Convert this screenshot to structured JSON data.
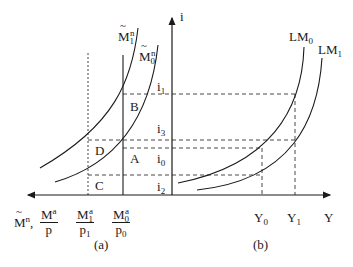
{
  "diagram": {
    "panels": [
      {
        "id": "a",
        "caption": "(a)"
      },
      {
        "id": "b",
        "caption": "(b)"
      }
    ],
    "axes": {
      "vertical_label": "i",
      "horizontal_right_label": "Y",
      "horizontal_left_label_main": "M",
      "horizontal_left_label_main_sup": "n",
      "horizontal_left_label_frac_num": "M",
      "horizontal_left_label_frac_num_sup": "a",
      "horizontal_left_label_frac_den": "p"
    },
    "curves": {
      "m1n": {
        "base": "M",
        "sub": "1",
        "sup": "n"
      },
      "m0n": {
        "base": "M",
        "sub": "0",
        "sup": "n"
      },
      "lm0": {
        "base": "LM",
        "sub": "0"
      },
      "lm1": {
        "base": "LM",
        "sub": "1"
      }
    },
    "interest_levels": [
      {
        "base": "i",
        "sub": "1"
      },
      {
        "base": "i",
        "sub": "3"
      },
      {
        "base": "i",
        "sub": "0"
      },
      {
        "base": "i",
        "sub": "2"
      }
    ],
    "points": [
      "B",
      "D",
      "A",
      "C"
    ],
    "x_ticks_left": [
      {
        "num": "M",
        "num_sub": "1",
        "num_sup": "a",
        "den": "p",
        "den_sub": "1"
      },
      {
        "num": "M",
        "num_sub": "0",
        "num_sup": "a",
        "den": "p",
        "den_sub": "0"
      }
    ],
    "x_ticks_right": [
      {
        "base": "Y",
        "sub": "0"
      },
      {
        "base": "Y",
        "sub": "1"
      }
    ],
    "colors": {
      "line": "#1a1a1a",
      "background": "#ffffff"
    }
  }
}
